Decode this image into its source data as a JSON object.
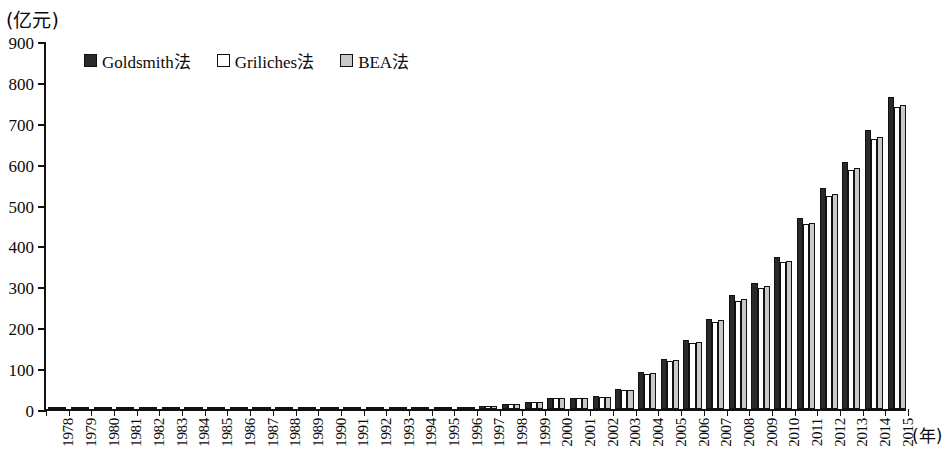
{
  "chart_data": {
    "type": "bar",
    "title": "",
    "subtitle": "",
    "xlabel": "(年)",
    "ylabel": "(亿元)",
    "ylim": [
      0,
      900
    ],
    "ytick_step": 100,
    "yticks": [
      900,
      800,
      700,
      600,
      500,
      400,
      300,
      200,
      100,
      0
    ],
    "grid": false,
    "legend_position": "top-left",
    "categories": [
      "1978",
      "1979",
      "1980",
      "1981",
      "1982",
      "1983",
      "1984",
      "1985",
      "1986",
      "1987",
      "1988",
      "1989",
      "1990",
      "1991",
      "1992",
      "1993",
      "1994",
      "1995",
      "1996",
      "1997",
      "1998",
      "1999",
      "2000",
      "2001",
      "2002",
      "2003",
      "2004",
      "2005",
      "2006",
      "2007",
      "2008",
      "2009",
      "2010",
      "2011",
      "2012",
      "2013",
      "2014",
      "2015"
    ],
    "series": [
      {
        "name": "Goldsmith法",
        "color": "#2a2a2a",
        "values": [
          2,
          2,
          2,
          2,
          2,
          2,
          2,
          2,
          2,
          2,
          2,
          2,
          2,
          2,
          6,
          6,
          3,
          3,
          4,
          8,
          13,
          18,
          27,
          27,
          31,
          50,
          91,
          122,
          169,
          221,
          278,
          309,
          372,
          467,
          540,
          604,
          683,
          762
        ]
      },
      {
        "name": "Griliches法",
        "color": "#ffffff",
        "values": [
          2,
          2,
          2,
          2,
          2,
          2,
          2,
          2,
          2,
          2,
          2,
          2,
          2,
          2,
          5,
          5,
          3,
          3,
          4,
          8,
          12,
          17,
          26,
          26,
          30,
          46,
          85,
          117,
          162,
          214,
          264,
          296,
          359,
          452,
          521,
          585,
          660,
          739
        ]
      },
      {
        "name": "BEA法",
        "color": "#c9c9c9",
        "values": [
          2,
          2,
          2,
          2,
          2,
          2,
          2,
          2,
          2,
          2,
          2,
          2,
          2,
          2,
          5,
          5,
          3,
          3,
          4,
          8,
          12,
          17,
          26,
          26,
          30,
          47,
          87,
          119,
          165,
          217,
          268,
          300,
          363,
          456,
          527,
          590,
          665,
          744
        ]
      }
    ]
  },
  "legend": {
    "items": [
      {
        "label": "Goldsmith法",
        "swatch": "#2a2a2a"
      },
      {
        "label": "Griliches法",
        "swatch": "#ffffff"
      },
      {
        "label": "BEA法",
        "swatch": "#c9c9c9"
      }
    ]
  },
  "axes": {
    "y_unit_label": "(亿元)",
    "x_unit_label": "(年)"
  }
}
